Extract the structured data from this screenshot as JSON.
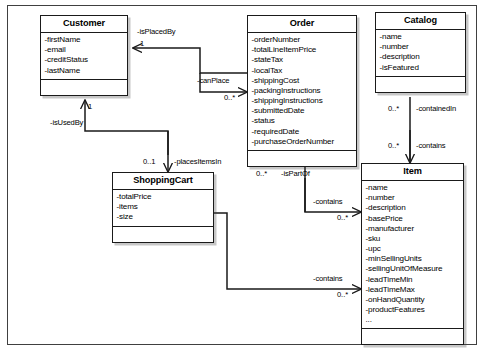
{
  "diagram": {
    "type": "uml-class-diagram",
    "title": "",
    "background": "#ffffff",
    "line_color": "#1a1a1a"
  },
  "classes": [
    {
      "id": "customer",
      "name": "Customer",
      "attributes": [
        "-firstName",
        "-email",
        "-creditStatus",
        "-lastName"
      ],
      "operations": []
    },
    {
      "id": "order",
      "name": "Order",
      "attributes": [
        "-orderNumber",
        "-totalLineItemPrice",
        "-stateTax",
        "-localTax",
        "-shippingCost",
        "-packingInstructions",
        "-shippingInstructions",
        "-submittedDate",
        "-status",
        "-requiredDate",
        "-purchaseOrderNumber"
      ],
      "operations": []
    },
    {
      "id": "catalog",
      "name": "Catalog",
      "attributes": [
        "-name",
        "-number",
        "-description",
        "-isFeatured"
      ],
      "operations": []
    },
    {
      "id": "shoppingcart",
      "name": "ShoppingCart",
      "attributes": [
        "-totalPrice",
        "-items",
        "-size"
      ],
      "operations": []
    },
    {
      "id": "item",
      "name": "Item",
      "attributes": [
        "-name",
        "-number",
        "-description",
        "-basePrice",
        "-manufacturer",
        "-sku",
        "-upc",
        "-minSellingUnits",
        "-sellingUnitOfMeasure",
        "-leadTimeMin",
        "-leadTimeMax",
        "-onHandQuantity",
        "-productFeatures",
        "..."
      ],
      "operations": []
    }
  ],
  "relationships": [
    {
      "id": "order-isplacedby-customer",
      "from": "order",
      "to": "customer",
      "role": "-isPlacedBy",
      "multiplicity": "1"
    },
    {
      "id": "customer-canplace-order",
      "from": "customer",
      "to": "order",
      "role": "-canPlace",
      "multiplicity": "0..*"
    },
    {
      "id": "shoppingcart-isusedby-customer",
      "from": "shoppingcart",
      "to": "customer",
      "role": "-isUsedBy",
      "multiplicity": "1"
    },
    {
      "id": "customer-placesitemsin-shoppingcart",
      "from": "customer",
      "to": "shoppingcart",
      "role": "-placesItemsIn",
      "multiplicity": "0..1"
    },
    {
      "id": "item-ispartof-order",
      "from": "item",
      "to": "order",
      "role": "-isPartOf",
      "multiplicity": "0..*"
    },
    {
      "id": "order-contains-item",
      "from": "order",
      "to": "item",
      "role": "-contains",
      "multiplicity": "0..*"
    },
    {
      "id": "shoppingcart-contains-item",
      "from": "shoppingcart",
      "to": "item",
      "role": "-contains",
      "multiplicity": "0..*"
    },
    {
      "id": "item-containedin-catalog",
      "from": "item",
      "to": "catalog",
      "role": "-containedIn",
      "multiplicity": "0..*"
    },
    {
      "id": "catalog-contains-item",
      "from": "catalog",
      "to": "item",
      "role": "-contains",
      "multiplicity": "0..*"
    }
  ]
}
